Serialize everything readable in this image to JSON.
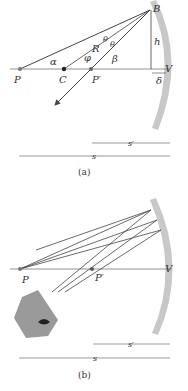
{
  "figure_a": {
    "caption": "(a)",
    "points": {
      "P": "P",
      "C": "C",
      "P_prime": "P′",
      "B": "B",
      "V": "V"
    },
    "angles": {
      "alpha": "α",
      "phi": "φ",
      "beta": "β",
      "theta1": "θ",
      "theta2": "θ"
    },
    "lengths": {
      "R": "R",
      "h": "h",
      "delta": "δ"
    },
    "dimensions": {
      "s_prime": "s′",
      "s": "s"
    }
  },
  "figure_b": {
    "caption": "(b)",
    "points": {
      "P": "P",
      "P_prime": "P′",
      "V": "V"
    },
    "dimensions": {
      "s_prime": "s′",
      "s": "s"
    }
  },
  "colors": {
    "mirror": "#c8c8c8",
    "line": "#444444",
    "axis": "#777777",
    "face": "#9a9a9a"
  }
}
